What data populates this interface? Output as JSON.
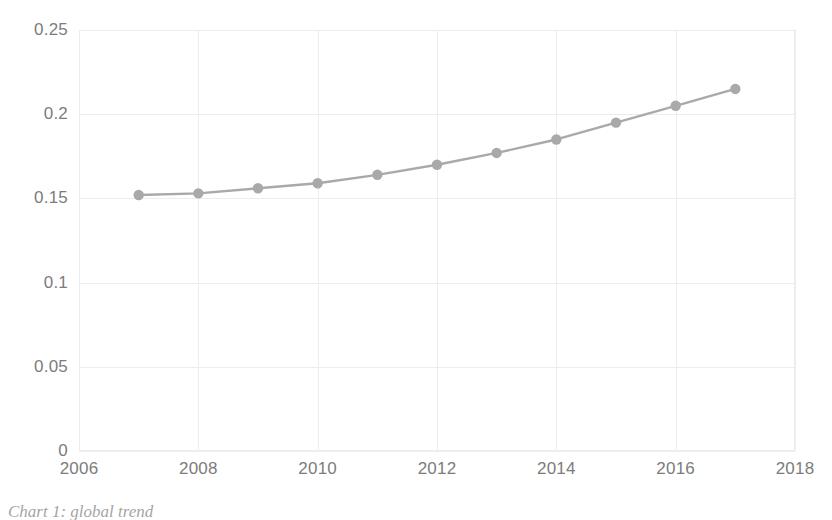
{
  "chart_data": {
    "type": "line",
    "title": "",
    "subtitle": "",
    "xlabel": "",
    "ylabel": "",
    "x": [
      2007,
      2008,
      2009,
      2010,
      2011,
      2012,
      2013,
      2014,
      2015,
      2016,
      2017
    ],
    "values": [
      0.152,
      0.153,
      0.156,
      0.159,
      0.164,
      0.17,
      0.177,
      0.185,
      0.195,
      0.205,
      0.215
    ],
    "series": [
      {
        "name": "",
        "values": [
          0.152,
          0.153,
          0.156,
          0.159,
          0.164,
          0.17,
          0.177,
          0.185,
          0.195,
          0.205,
          0.215
        ]
      }
    ],
    "xlim": [
      2006,
      2018
    ],
    "ylim": [
      0,
      0.25
    ],
    "x_tick_labels": [
      "2006",
      "2008",
      "2010",
      "2012",
      "2014",
      "2016",
      "2018"
    ],
    "x_tick_values": [
      2006,
      2008,
      2010,
      2012,
      2014,
      2016,
      2018
    ],
    "y_tick_labels": [
      "0",
      "0.05",
      "0.1",
      "0.15",
      "0.2",
      "0.25"
    ],
    "y_tick_values": [
      0,
      0.05,
      0.1,
      0.15,
      0.2,
      0.25
    ],
    "grid": true,
    "grid_axis": "both",
    "legend": false,
    "legend_position": "none",
    "marker": "circle",
    "annotations": []
  },
  "style": {
    "line_color": "#a9a9a9",
    "marker_color": "#a9a9a9",
    "grid_color": "#ededed",
    "tick_label_color": "#7c7c7c",
    "background": "#ffffff"
  },
  "caption": {
    "text": "Chart 1: global trend",
    "note": "clipped at bottom image edge"
  }
}
